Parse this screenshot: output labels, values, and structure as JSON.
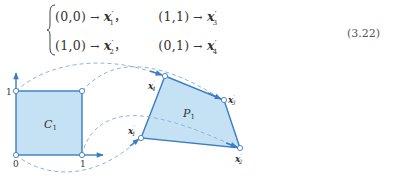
{
  "equation": {
    "number": "(3.22)",
    "rows": [
      {
        "left": {
          "from": "(0,0)",
          "to_var": "x",
          "to_sub": "1"
        },
        "right": {
          "from": "(1,1)",
          "to_var": "x",
          "to_sub": "3"
        }
      },
      {
        "left": {
          "from": "(1,0)",
          "to_var": "x",
          "to_sub": "2"
        },
        "right": {
          "from": "(0,1)",
          "to_var": "x",
          "to_sub": "4"
        }
      }
    ],
    "arrow": "→",
    "prime": "′",
    "comma": "，"
  },
  "figure": {
    "square_label": "C",
    "square_label_sub": "1",
    "polygon_label": "P",
    "polygon_label_sub": "1",
    "axis_ticks": {
      "origin": "0",
      "x_one": "1",
      "y_one": "1"
    },
    "vertex_labels": [
      {
        "var": "x",
        "sub": "1",
        "prime": "′"
      },
      {
        "var": "x",
        "sub": "2",
        "prime": "′"
      },
      {
        "var": "x",
        "sub": "3",
        "prime": "′"
      },
      {
        "var": "x",
        "sub": "4",
        "prime": "′"
      }
    ],
    "colors": {
      "fill": "#c5e2f5",
      "stroke": "#3b7cc4",
      "dash": "#8fb4d9",
      "arrow": "#3b7cc4"
    }
  }
}
